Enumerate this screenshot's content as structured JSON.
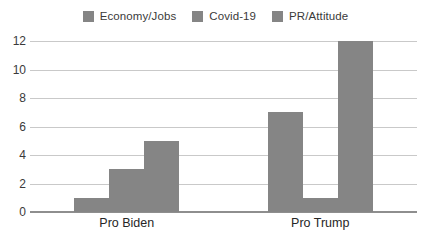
{
  "chart_data": {
    "type": "bar",
    "title": "",
    "xlabel": "",
    "ylabel": "",
    "categories": [
      "Pro Biden",
      "Pro Trump"
    ],
    "series": [
      {
        "name": "Economy/Jobs",
        "values": [
          1,
          7
        ],
        "color": "#858585"
      },
      {
        "name": "Covid-19",
        "values": [
          3,
          1
        ],
        "color": "#858585"
      },
      {
        "name": "PR/Attitude",
        "values": [
          5,
          12
        ],
        "color": "#858585"
      }
    ],
    "ylim": [
      0,
      12
    ],
    "yticks": [
      0,
      2,
      4,
      6,
      8,
      10,
      12
    ],
    "ytick_labels": [
      "0",
      "2",
      "4",
      "6",
      "8",
      "10",
      "12"
    ],
    "grid": true,
    "legend_position": "top-center"
  },
  "legend": {
    "items": [
      {
        "label": "Economy/Jobs",
        "swatch_color": "#858585"
      },
      {
        "label": "Covid-19",
        "swatch_color": "#858585"
      },
      {
        "label": "PR/Attitude",
        "swatch_color": "#858585"
      }
    ]
  },
  "axes": {
    "y_tick_labels": [
      "12",
      "10",
      "8",
      "6",
      "4",
      "2",
      "0"
    ],
    "x_tick_labels": [
      "Pro Biden",
      "Pro Trump"
    ]
  },
  "colors": {
    "bar_fill": "#858585",
    "gridline": "#c9c9c9",
    "axis": "#8e8e8e",
    "text": "#3a3a3a",
    "background": "#ffffff"
  }
}
